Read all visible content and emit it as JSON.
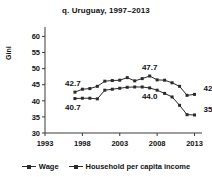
{
  "chart_data": {
    "type": "line",
    "title": "q. Uruguay, 1997–2013",
    "xlabel": "",
    "ylabel": "Gini",
    "xlim": [
      1993,
      2014
    ],
    "ylim": [
      30,
      62
    ],
    "xticks": [
      1993,
      1998,
      2003,
      2008,
      2013
    ],
    "yticks": [
      30,
      35,
      40,
      45,
      50,
      55,
      60
    ],
    "grid": false,
    "legend_position": "bottom",
    "x": [
      1997,
      1998,
      1999,
      2000,
      2001,
      2002,
      2003,
      2004,
      2005,
      2006,
      2007,
      2008,
      2009,
      2010,
      2011,
      2012,
      2013
    ],
    "series": [
      {
        "name": "Wage",
        "values": [
          40.7,
          40.8,
          40.8,
          40.6,
          43.3,
          43.6,
          43.9,
          44.2,
          44.3,
          44.3,
          44.0,
          43.3,
          42.3,
          41.2,
          38.6,
          35.7,
          35.6
        ],
        "marker": "square",
        "color": "#2a2a2a"
      },
      {
        "name": "Household per capita income",
        "values": [
          42.7,
          43.6,
          43.8,
          44.5,
          46.1,
          46.3,
          46.4,
          47.2,
          46.2,
          46.9,
          47.7,
          46.5,
          46.4,
          45.6,
          44.5,
          41.7,
          42.0
        ],
        "marker": "square",
        "color": "#2a2a2a"
      }
    ],
    "annotations": [
      {
        "text": "42.7",
        "x": 1997,
        "y": 42.7,
        "series": "Household per capita income",
        "position": "above-left"
      },
      {
        "text": "40.7",
        "x": 1997,
        "y": 40.7,
        "series": "Wage",
        "position": "below-left"
      },
      {
        "text": "47.7",
        "x": 2007,
        "y": 47.7,
        "series": "Household per capita income",
        "position": "above"
      },
      {
        "text": "44.0",
        "x": 2007,
        "y": 44.0,
        "series": "Wage",
        "position": "below"
      },
      {
        "text": "42.0",
        "x": 2013,
        "y": 42.0,
        "series": "Household per capita income",
        "position": "above-right"
      },
      {
        "text": "35.0",
        "x": 2013,
        "y": 35.6,
        "series": "Wage",
        "position": "above-right"
      }
    ]
  },
  "legend": {
    "items": [
      {
        "label": "Wage"
      },
      {
        "label": "Household per capita income"
      }
    ]
  }
}
